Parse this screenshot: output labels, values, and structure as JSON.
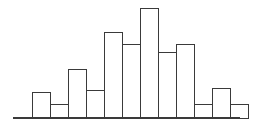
{
  "chart_data": {
    "type": "bar",
    "title": "",
    "subtitle": "",
    "xlabel": "",
    "ylabel": "",
    "grid": false,
    "legend": false,
    "legend_position": "none",
    "x_tick_labels": [],
    "y_tick_labels": [],
    "axis_ranges": {
      "xlim": [
        0,
        12
      ],
      "ylim": [
        0,
        12
      ]
    },
    "bar_style": {
      "fill": "#ffffff",
      "edge_color": "#3a3a3a",
      "edge_width": 1.15,
      "bar_width_px": 18,
      "gap_px": 0
    },
    "axis_style": {
      "baseline_color": "#3a3a3a",
      "baseline_width": 1.4,
      "baseline_start_px": 13,
      "baseline_end_px": 240,
      "baseline_y_px": 118
    },
    "categories": [
      "1",
      "2",
      "3",
      "4",
      "5",
      "6",
      "7",
      "8",
      "9",
      "10",
      "11",
      "12"
    ],
    "values": [
      2.6,
      1.4,
      4.9,
      2.8,
      8.6,
      7.4,
      11.0,
      6.6,
      7.4,
      1.4,
      3.0,
      1.4
    ],
    "bars_px": [
      {
        "index": 0,
        "x": 32,
        "width": 18,
        "top": 92,
        "height": 26
      },
      {
        "index": 1,
        "x": 50,
        "width": 18,
        "top": 104,
        "height": 14
      },
      {
        "index": 2,
        "x": 68,
        "width": 18,
        "top": 69,
        "height": 49
      },
      {
        "index": 3,
        "x": 86,
        "width": 18,
        "top": 90,
        "height": 28
      },
      {
        "index": 4,
        "x": 104,
        "width": 18,
        "top": 32,
        "height": 86
      },
      {
        "index": 5,
        "x": 122,
        "width": 18,
        "top": 44,
        "height": 74
      },
      {
        "index": 6,
        "x": 140,
        "width": 18,
        "top": 8,
        "height": 110
      },
      {
        "index": 7,
        "x": 158,
        "width": 18,
        "top": 52,
        "height": 66
      },
      {
        "index": 8,
        "x": 176,
        "width": 18,
        "top": 44,
        "height": 74
      },
      {
        "index": 9,
        "x": 194,
        "width": 18,
        "top": 104,
        "height": 14
      },
      {
        "index": 10,
        "x": 212,
        "width": 18,
        "top": 88,
        "height": 30
      },
      {
        "index": 11,
        "x": 230,
        "width": 18,
        "top": 104,
        "height": 14
      }
    ],
    "annotations": []
  },
  "figure": {
    "width": 254,
    "height": 127,
    "background": "#ffffff"
  }
}
